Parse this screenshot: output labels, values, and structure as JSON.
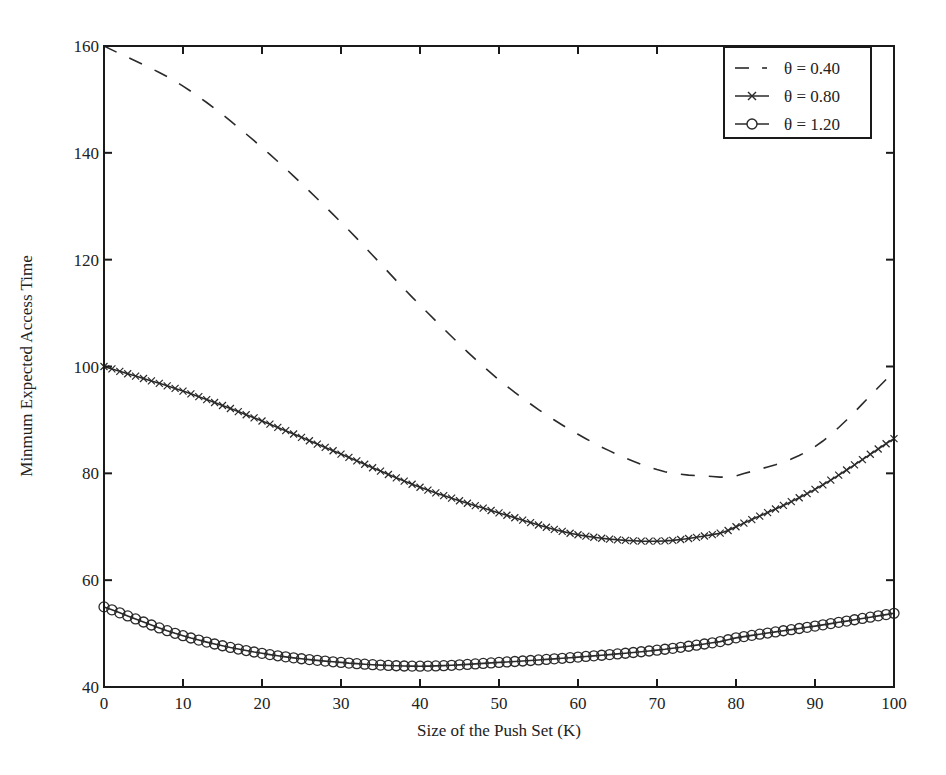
{
  "chart_data": {
    "type": "line",
    "title": "",
    "xlabel": "Size of the Push Set (K)",
    "ylabel": "Minmum Expected Access Time",
    "xlim": [
      0,
      100
    ],
    "ylim": [
      40,
      160
    ],
    "xticks": [
      0,
      10,
      20,
      30,
      40,
      50,
      60,
      70,
      80,
      90,
      100
    ],
    "yticks": [
      40,
      60,
      80,
      100,
      120,
      140,
      160
    ],
    "grid": false,
    "legend_position": "upper right",
    "x": [
      0,
      10,
      20,
      30,
      40,
      50,
      60,
      70,
      78,
      80,
      90,
      100
    ],
    "series": [
      {
        "name": "θ = 0.40",
        "style": "dashed",
        "marker": "none",
        "values": [
          160,
          152.5,
          141,
          127,
          111.5,
          97.5,
          87.3,
          80.7,
          79.3,
          79.5,
          85,
          99
        ]
      },
      {
        "name": "θ = 0.80",
        "style": "solid",
        "marker": "x",
        "values": [
          100,
          95.4,
          89.8,
          83.6,
          77.4,
          72.6,
          68.5,
          67.3,
          68.8,
          70,
          77,
          86.5
        ]
      },
      {
        "name": "θ = 1.20",
        "style": "solid",
        "marker": "o",
        "values": [
          55,
          49.6,
          46.3,
          44.6,
          43.9,
          44.6,
          45.6,
          46.9,
          48.5,
          49.2,
          51.4,
          53.8
        ]
      }
    ]
  },
  "axes": {
    "xlabel": "Size of the Push Set (K)",
    "ylabel": "Minmum Expected Access Time",
    "xtick_labels": [
      "0",
      "10",
      "20",
      "30",
      "40",
      "50",
      "60",
      "70",
      "80",
      "90",
      "100"
    ],
    "ytick_labels": [
      "40",
      "60",
      "80",
      "100",
      "120",
      "140",
      "160"
    ]
  },
  "legend": {
    "items": [
      {
        "label": "θ = 0.40",
        "style": "dashed",
        "marker": "none"
      },
      {
        "label": "θ = 0.80",
        "style": "solid",
        "marker": "x"
      },
      {
        "label": "θ = 1.20",
        "style": "solid",
        "marker": "o"
      }
    ]
  },
  "colors": {
    "line": "#2a2a2a",
    "axis": "#1a1a1a",
    "background": "#ffffff"
  }
}
